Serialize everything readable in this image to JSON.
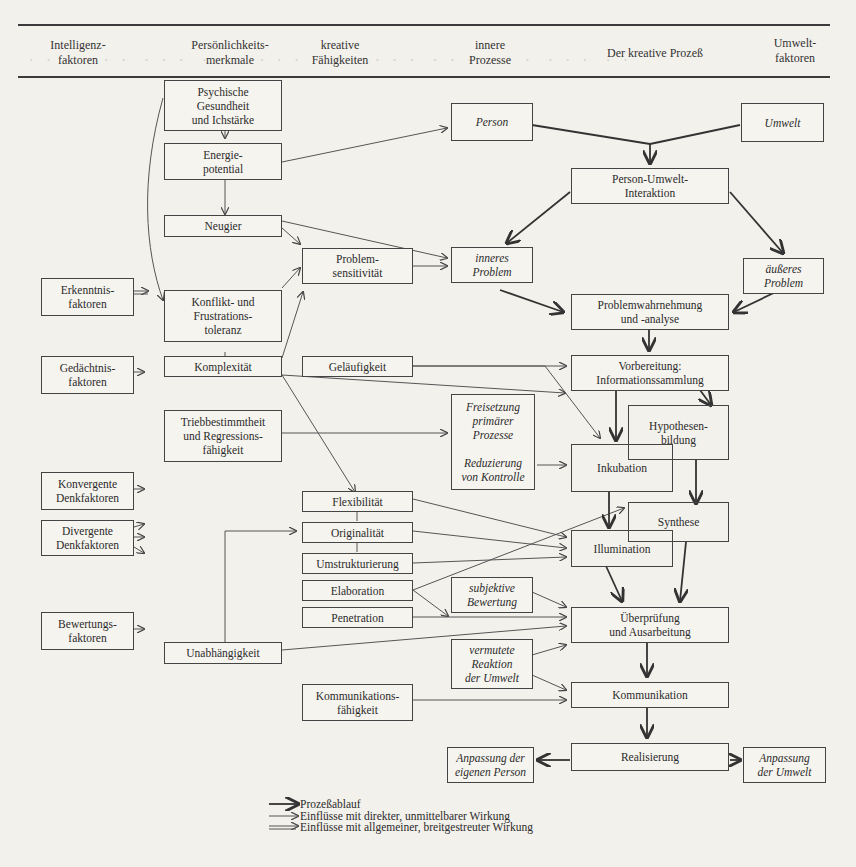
{
  "headers": {
    "intelligenz": "Intelligenz-\nfaktoren",
    "persoenlichkeit": "Persönlichkeits-\nmerkmale",
    "kreativ": "kreative\nFähigkeiten",
    "innere": "innere\nProzesse",
    "prozess": "Der kreative Prozeß",
    "umwelt": "Umwelt-\nfaktoren"
  },
  "intelligence_factors": {
    "erkenntnis": "Erkenntnis-\nfaktoren",
    "gedaechtnis": "Gedächtnis-\nfaktoren",
    "konvergent": "Konvergente\nDenkfaktoren",
    "divergent": "Divergente\nDenkfaktoren",
    "bewertung": "Bewertungs-\nfaktoren"
  },
  "personality": {
    "psychische": "Psychische\nGesundheit\nund Ichstärke",
    "energie": "Energie-\npotential",
    "neugier": "Neugier",
    "konflikt": "Konflikt- und\nFrustrations-\ntoleranz",
    "komplexitaet": "Komplexität",
    "trieb": "Triebbestimmtheit\nund Regressions-\nfähigkeit",
    "unabhaengigkeit": "Unabhängigkeit"
  },
  "abilities": {
    "problemsens": "Problem-\nsensitivität",
    "gelaeufigkeit": "Geläufigkeit",
    "flexibilitaet": "Flexibilität",
    "originalitaet": "Originalität",
    "umstrukturierung": "Umstrukturierung",
    "elaboration": "Elaboration",
    "penetration": "Penetration",
    "kommunikationsf": "Kommunikations-\nfähigkeit"
  },
  "inner_processes": {
    "person": "Person",
    "inneres": "inneres\nProblem",
    "freisetzung": "Freisetzung\nprimärer\nProzesse\n\nReduzierung\nvon Kontrolle",
    "subjektiv": "subjektive\nBewertung",
    "vermutet": "vermutete\nReaktion\nder Umwelt",
    "anpassung_person": "Anpassung der\neigenen Person"
  },
  "process": {
    "interaktion": "Person-Umwelt-\nInteraktion",
    "wahrnehmung": "Problemwahrnehmung\nund -analyse",
    "vorbereitung": "Vorbereitung:\nInformationssammlung",
    "hypothesen": "Hypothesen-\nbildung",
    "inkubation": "Inkubation",
    "synthese": "Synthese",
    "illumination": "Illumination",
    "ueberpruefung": "Überprüfung\nund Ausarbeitung",
    "kommunikation": "Kommunikation",
    "realisierung": "Realisierung"
  },
  "environment": {
    "umwelt": "Umwelt",
    "aeusseres": "äußeres\nProblem",
    "anpassung_umwelt": "Anpassung\nder Umwelt"
  },
  "legend": {
    "process_flow": "Prozeßablauf",
    "direct_influence": "Einflüsse mit direkter, unmittelbarer Wirkung",
    "general_influence": "Einflüsse mit allgemeiner, breitgestreuter Wirkung"
  }
}
